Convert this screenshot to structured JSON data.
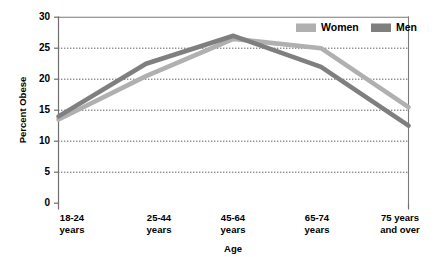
{
  "chart_data": {
    "type": "line",
    "title": "",
    "xlabel": "Age",
    "ylabel": "Percent Obese",
    "categories": [
      "18-24\nyears",
      "25-44\nyears",
      "45-64\nyears",
      "65-74\nyears",
      "75 years\nand over"
    ],
    "category_lines": [
      [
        "18-24",
        "years"
      ],
      [
        "25-44",
        "years"
      ],
      [
        "45-64",
        "years"
      ],
      [
        "65-74",
        "years"
      ],
      [
        "75 years",
        "and over"
      ]
    ],
    "series": [
      {
        "name": "Women",
        "values": [
          13.5,
          20.5,
          26.5,
          25.0,
          15.5
        ],
        "color": "#b0b0b0"
      },
      {
        "name": "Men",
        "values": [
          14.0,
          22.5,
          27.0,
          22.0,
          12.5
        ],
        "color": "#7f7f7f"
      }
    ],
    "ylim": [
      0,
      30
    ],
    "yticks": [
      0,
      5,
      10,
      15,
      20,
      25,
      30
    ],
    "ytick_labels": [
      "0",
      "5",
      "10",
      "15",
      "20",
      "25",
      "30"
    ],
    "grid": true,
    "grid_axis": "y",
    "legend_position": "top-right"
  },
  "legend": {
    "entries": [
      {
        "label": "Women",
        "color": "#b0b0b0"
      },
      {
        "label": "Men",
        "color": "#7f7f7f"
      }
    ]
  },
  "axes": {
    "y_title": "Percent Obese",
    "x_title": "Age"
  },
  "colors": {
    "women": "#b0b0b0",
    "men": "#7f7f7f",
    "gridline": "#4d4d4d",
    "frame": "#7a7a7a",
    "background": "#ffffff",
    "text": "#000000"
  }
}
